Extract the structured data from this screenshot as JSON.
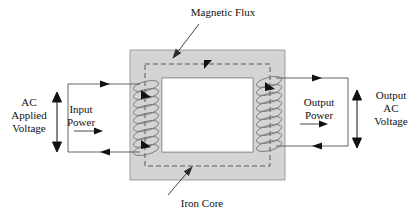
{
  "diagram": {
    "colors": {
      "core_fill": "#d4d4d4",
      "core_stroke": "#6a6a6a",
      "flux_dash": "#4a4a4a",
      "wire": "#555555",
      "coil": "#777777",
      "text": "#111111",
      "background": "#ffffff"
    },
    "labels": {
      "magnetic_flux": "Magnetic Flux",
      "iron_core": "Iron Core",
      "ac_applied_voltage": "AC\nApplied\nVoltage",
      "input_power": "Input\nPower",
      "output_power": "Output\nPower",
      "output_ac_voltage": "Output\nAC\nVoltage"
    },
    "icons": {
      "flux_leader": "leader-line-arrow-icon",
      "core_leader": "leader-line-arrow-icon",
      "primary_voltage_arrow": "double-headed-vertical-arrow-icon",
      "secondary_voltage_arrow": "double-headed-vertical-arrow-icon",
      "input_power_arrow": "right-arrow-icon",
      "output_power_arrow": "right-arrow-icon",
      "primary_top_current_arrow": "right-arrow-icon",
      "primary_bottom_current_arrow": "left-arrow-icon",
      "secondary_top_current_arrow": "right-arrow-icon",
      "secondary_bottom_current_arrow": "left-arrow-icon",
      "flux_top_arrow": "flux-direction-arrow-icon",
      "flux_left_upper_arrow": "flux-direction-arrow-icon",
      "flux_left_lower_arrow": "flux-direction-arrow-icon",
      "flux_right_arrow": "flux-direction-arrow-icon"
    },
    "geometry": {
      "core_outer": [
        130,
        50,
        155,
        130
      ],
      "core_window": [
        162,
        78,
        91,
        74
      ],
      "flux_loop": [
        145,
        64,
        125,
        102
      ],
      "primary_leg_x": 146,
      "secondary_leg_x": 269,
      "winding_turns": 9
    }
  }
}
